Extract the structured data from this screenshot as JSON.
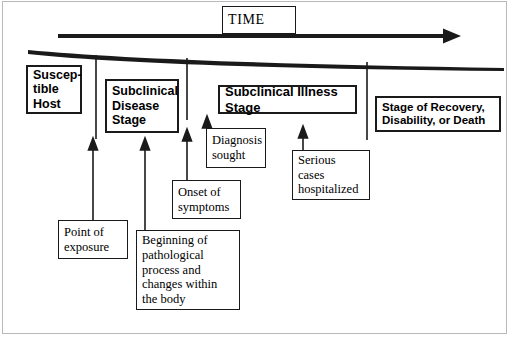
{
  "figure": {
    "line_color": "#1a1a1a",
    "background": "#ffffff"
  },
  "timeline": {
    "label": "TIME",
    "arrow_direction": "right"
  },
  "stages": [
    {
      "id": "susceptible",
      "label": "Suscep-\ntible\nHost",
      "emphasis": "bold"
    },
    {
      "id": "subclinical_disease",
      "label": "Subclinical\nDisease\nStage",
      "emphasis": "bold"
    },
    {
      "id": "subclinical_illness",
      "label": "Subclinical Illness Stage",
      "emphasis": "bold"
    },
    {
      "id": "recovery",
      "label": "Stage of Recovery,\nDisability, or Death",
      "emphasis": "bold"
    }
  ],
  "events": [
    {
      "id": "point_of_exposure",
      "label": "Point of\nexposure"
    },
    {
      "id": "beginning_pathological",
      "label": "Beginning of\npathological\nprocess and\nchanges within\nthe body"
    },
    {
      "id": "onset_of_symptoms",
      "label": "Onset of\nsymptoms"
    },
    {
      "id": "diagnosis_sought",
      "label": "Diagnosis\nsought"
    },
    {
      "id": "serious_cases",
      "label": "Serious\ncases\nhospitalized"
    }
  ]
}
